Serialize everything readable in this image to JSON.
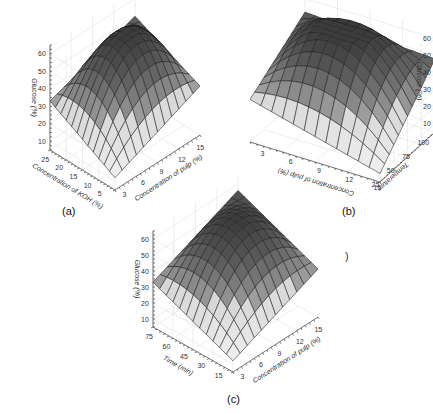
{
  "figure": {
    "panels": [
      {
        "id": "a",
        "caption": "(a)"
      },
      {
        "id": "b",
        "caption": "(b)"
      },
      {
        "id": "c",
        "caption": "(c)"
      }
    ],
    "stray_text": ")"
  },
  "chart_data": [
    {
      "type": "surface3d",
      "panel": "(a)",
      "title": "",
      "zlabel": "Glucose (%)",
      "xlabel": "Concentration of pulp (%)",
      "ylabel": "Concentration of KOH (%)",
      "z_ticks": [
        10,
        20,
        30,
        40,
        50,
        60
      ],
      "x_ticks": [
        3,
        6,
        9,
        12,
        15
      ],
      "y_ticks": [
        5,
        10,
        15,
        20,
        25
      ],
      "zlim": [
        5,
        65
      ],
      "surface": "dome-shaped response surface with maximum ~60% near center, edges ~30-35%",
      "corner_values": {
        "min_x_max_y": 33,
        "max_x_min_y": 33,
        "min_x_min_y": 10,
        "max_x_max_y": 55
      }
    },
    {
      "type": "surface3d",
      "panel": "(b)",
      "title": "",
      "zlabel": "Glucose (%)",
      "xlabel": "Concentration of pulp (%)",
      "ylabel": "Temperature",
      "z_ticks": [
        10,
        20,
        30,
        40,
        50,
        60
      ],
      "x_ticks": [
        15,
        12,
        9,
        6,
        3
      ],
      "y_ticks": [
        25,
        50,
        75,
        100
      ],
      "zlim": [
        5,
        65
      ],
      "surface": "dome-shaped response surface with maximum ~60% near center, edges ~30%",
      "corner_values": {
        "max_x_min_y": 30,
        "min_x_min_y": 8,
        "min_x_max_y": 48,
        "max_x_max_y": 55
      }
    },
    {
      "type": "surface3d",
      "panel": "(c)",
      "title": "",
      "zlabel": "Glucose (%)",
      "xlabel": "Concentration of pulp (%)",
      "ylabel": "Time (min)",
      "z_ticks": [
        10,
        20,
        30,
        40,
        50,
        60
      ],
      "x_ticks": [
        3,
        6,
        9,
        12,
        15
      ],
      "y_ticks": [
        15,
        30,
        45,
        60,
        75
      ],
      "zlim": [
        5,
        65
      ],
      "surface": "dome-shaped response surface with maximum ~60%, edges ~33%",
      "corner_values": {
        "min_x_max_y": 33,
        "min_x_min_y": 12,
        "max_x_min_y": 35,
        "max_x_max_y": 58
      }
    }
  ]
}
